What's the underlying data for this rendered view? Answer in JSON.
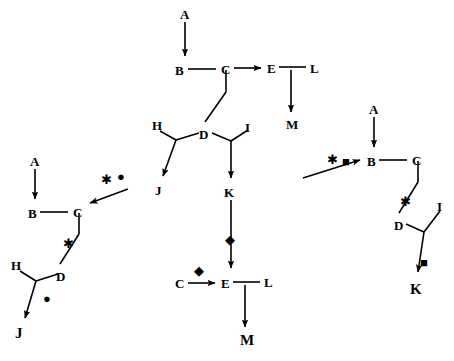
{
  "diagram": {
    "stroke_color": "#000000",
    "background": "#ffffff",
    "symbols": {
      "star": "✱",
      "circle": "●",
      "diamond": "◆",
      "square": "■"
    },
    "panels": [
      {
        "id": "top-center",
        "nodes": [
          {
            "label": "A",
            "x": 180,
            "y": 8
          },
          {
            "label": "B",
            "x": 175,
            "y": 64
          },
          {
            "label": "C",
            "x": 221,
            "y": 63
          },
          {
            "label": "E",
            "x": 267,
            "y": 62
          },
          {
            "label": "L",
            "x": 310,
            "y": 62
          },
          {
            "label": "M",
            "x": 286,
            "y": 118
          },
          {
            "label": "H",
            "x": 152,
            "y": 119
          },
          {
            "label": "D",
            "x": 199,
            "y": 128
          },
          {
            "label": "I",
            "x": 245,
            "y": 121
          },
          {
            "label": "J",
            "x": 155,
            "y": 184
          },
          {
            "label": "K",
            "x": 224,
            "y": 186
          }
        ],
        "symbols": []
      },
      {
        "id": "left",
        "nodes": [
          {
            "label": "A",
            "x": 30,
            "y": 155
          },
          {
            "label": "B",
            "x": 28,
            "y": 207
          },
          {
            "label": "C",
            "x": 73,
            "y": 206
          },
          {
            "label": "H",
            "x": 11,
            "y": 259
          },
          {
            "label": "D",
            "x": 56,
            "y": 270
          },
          {
            "label": "J",
            "x": 15,
            "y": 326
          }
        ],
        "symbols": [
          {
            "glyph": "✱",
            "x": 101,
            "y": 173
          },
          {
            "glyph": "●",
            "x": 117,
            "y": 170
          },
          {
            "glyph": "✱",
            "x": 63,
            "y": 237
          },
          {
            "glyph": "●",
            "x": 43,
            "y": 292
          }
        ]
      },
      {
        "id": "bottom-center",
        "nodes": [
          {
            "label": "C",
            "x": 175,
            "y": 277
          },
          {
            "label": "E",
            "x": 221,
            "y": 277
          },
          {
            "label": "L",
            "x": 264,
            "y": 276
          },
          {
            "label": "M",
            "x": 240,
            "y": 333
          }
        ],
        "symbols": [
          {
            "glyph": "◆",
            "x": 225,
            "y": 233
          },
          {
            "glyph": "◆",
            "x": 194,
            "y": 264
          }
        ]
      },
      {
        "id": "right",
        "nodes": [
          {
            "label": "A",
            "x": 369,
            "y": 103
          },
          {
            "label": "B",
            "x": 367,
            "y": 155
          },
          {
            "label": "C",
            "x": 412,
            "y": 154
          },
          {
            "label": "D",
            "x": 394,
            "y": 219
          },
          {
            "label": "I",
            "x": 437,
            "y": 200
          },
          {
            "label": "K",
            "x": 410,
            "y": 282
          }
        ],
        "symbols": [
          {
            "glyph": "✱",
            "x": 327,
            "y": 153
          },
          {
            "glyph": "■",
            "x": 342,
            "y": 155
          },
          {
            "glyph": "✱",
            "x": 400,
            "y": 195
          },
          {
            "glyph": "■",
            "x": 420,
            "y": 256
          }
        ]
      }
    ]
  }
}
